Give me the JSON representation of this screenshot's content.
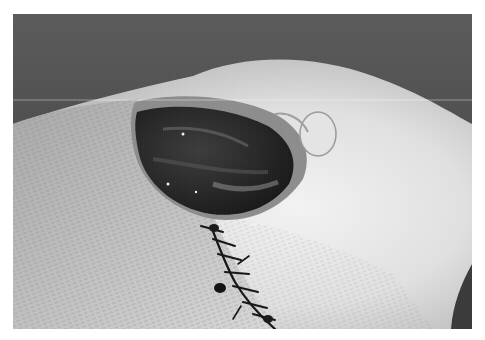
{
  "image": {
    "kind": "photograph",
    "tone": "grayscale",
    "subject": "Open wound with sutured incision on shaved skin",
    "alt": "Grayscale photograph of an open wound cavity with an adjacent sutured incision line on shaved skin"
  },
  "regions": {
    "background_top": {
      "description": "dark blurred background",
      "color": "#4e4e4e"
    },
    "skin_surface": {
      "description": "pale shaved skin with stubble texture",
      "color": "#d9d9d9"
    },
    "wound": {
      "description": "dark open wound cavity",
      "color": "#2a2a2a"
    },
    "suture_line": {
      "description": "black stitched incision running diagonally downward",
      "color": "#1a1a1a"
    },
    "right_edge_shadow": {
      "description": "dark shadow at lower right corner",
      "color": "#3a3a3a"
    }
  },
  "colors": {
    "border": "#ffffff",
    "dark": "#4a4a4a",
    "light": "#e6e6e6",
    "highlight": "#f4f4f4"
  }
}
